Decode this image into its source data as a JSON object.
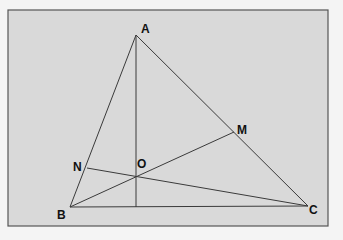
{
  "diagram": {
    "type": "geometry",
    "frame": {
      "x": 8,
      "y": 10,
      "width": 320,
      "height": 216,
      "fill": "#d9d9d9",
      "stroke": "#555555"
    },
    "points": {
      "A": {
        "label": "A",
        "x": 136,
        "y": 35,
        "lx": 141,
        "ly": 33
      },
      "B": {
        "label": "B",
        "x": 70,
        "y": 207,
        "lx": 57,
        "ly": 219
      },
      "C": {
        "label": "C",
        "x": 308,
        "y": 206,
        "lx": 309,
        "ly": 214
      },
      "M": {
        "label": "M",
        "x": 234,
        "y": 132,
        "lx": 237,
        "ly": 134
      },
      "N": {
        "label": "N",
        "x": 87,
        "y": 168,
        "lx": 73,
        "ly": 171
      },
      "O": {
        "label": "O",
        "x": 137,
        "y": 177,
        "lx": 137,
        "ly": 168
      },
      "H": {
        "label": "",
        "x": 136,
        "y": 207
      }
    },
    "segments": [
      [
        "A",
        "B"
      ],
      [
        "A",
        "C"
      ],
      [
        "B",
        "C"
      ],
      [
        "A",
        "H"
      ],
      [
        "B",
        "M"
      ],
      [
        "C",
        "N"
      ]
    ]
  }
}
